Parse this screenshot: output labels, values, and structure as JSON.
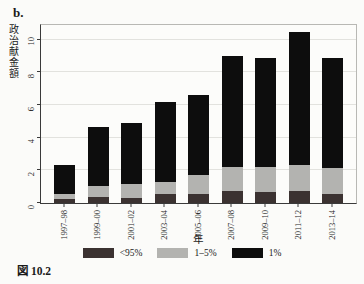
{
  "figure": {
    "panel_label": "b.",
    "caption": "図 10.2"
  },
  "chart_data": {
    "type": "bar",
    "stacked": true,
    "title": "",
    "xlabel": "年",
    "ylabel": "政治献金額",
    "categories": [
      "1997–98",
      "1999–00",
      "2001–02",
      "2003–04",
      "2005–06",
      "2007–08",
      "2009–10",
      "2011–12",
      "2013–14"
    ],
    "series": [
      {
        "name": "<95%",
        "color": "#3b3231",
        "values": [
          0.25,
          0.35,
          0.3,
          0.55,
          0.55,
          0.75,
          0.65,
          0.75,
          0.55
        ]
      },
      {
        "name": "1–5%",
        "color": "#b3b3b0",
        "values": [
          0.3,
          0.7,
          0.85,
          0.75,
          1.15,
          1.45,
          1.55,
          1.6,
          1.6
        ]
      },
      {
        "name": "1%",
        "color": "#0d0d0d",
        "values": [
          1.75,
          3.6,
          3.75,
          4.9,
          4.9,
          6.8,
          6.7,
          8.1,
          6.75
        ]
      }
    ],
    "totals": [
      2.3,
      4.65,
      4.9,
      6.2,
      6.6,
      9.0,
      8.9,
      10.45,
      8.9
    ],
    "yticks": [
      0,
      2,
      4,
      6,
      8,
      10
    ],
    "ylim": [
      0,
      10.9
    ],
    "grid": true,
    "legend_position": "bottom"
  },
  "colors": {
    "background": "#fbfbf9",
    "axis": "#3a3a3a",
    "gridline": "#e2e2de",
    "plot_border": "#b8b8b4",
    "text": "#1a1a1a"
  }
}
